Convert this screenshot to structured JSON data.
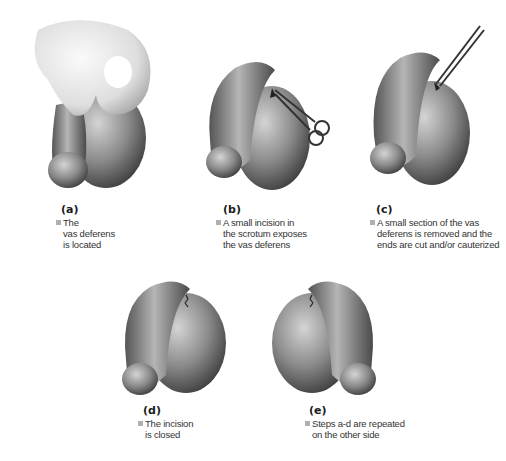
{
  "figure": {
    "panels": [
      {
        "id": "a",
        "label": "(a)",
        "caption_lines": [
          "The",
          "vas deferens",
          "is located"
        ]
      },
      {
        "id": "b",
        "label": "(b)",
        "caption_lines": [
          "A small incision in",
          "the scrotum exposes",
          "the vas deferens"
        ]
      },
      {
        "id": "c",
        "label": "(c)",
        "caption_lines": [
          "A small section of the vas",
          "deferens is removed and the",
          "ends are cut and/or cauterized"
        ]
      },
      {
        "id": "d",
        "label": "(d)",
        "caption_lines": [
          "The incision",
          "is closed"
        ]
      },
      {
        "id": "e",
        "label": "(e)",
        "caption_lines": [
          "Steps a-d are repeated",
          "on the other side"
        ]
      }
    ],
    "colors": {
      "skin_dark": "#3c3c3c",
      "skin_mid": "#8a8a8a",
      "skin_light": "#d0d0d0",
      "bullet": "#b0b0b0"
    }
  }
}
